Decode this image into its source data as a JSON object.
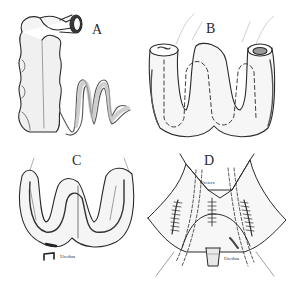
{
  "figure": {
    "panels": [
      {
        "id": "A",
        "label": "A",
        "description": "Bowel segment with attached mesentery loops"
      },
      {
        "id": "B",
        "label": "B",
        "description": "Bowel folded into W shape with dashed incision line"
      },
      {
        "id": "C",
        "label": "C",
        "description": "Opened W-shaped reservoir with urethra"
      },
      {
        "id": "D",
        "label": "D",
        "description": "Neobladder with ureters and urethra anastomosis"
      }
    ],
    "annotations": {
      "c_urethra": "Urethra",
      "d_ureters": "Ureters",
      "d_urethra": "Urethra"
    },
    "colors": {
      "ink": "#2a2a2a",
      "shade": "#8a8a8a",
      "mesentery": "#b9b9b9",
      "background": "#ffffff"
    }
  }
}
